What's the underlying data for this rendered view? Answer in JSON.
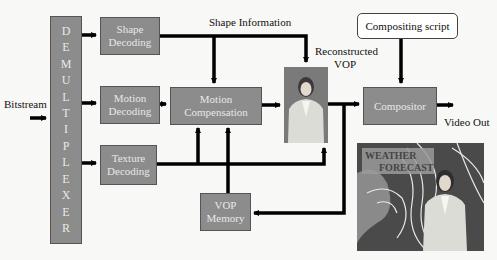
{
  "diagram": {
    "demux": {
      "letters": [
        "D",
        "E",
        "M",
        "U",
        "L",
        "T",
        "I",
        "P",
        "L",
        "E",
        "X",
        "E",
        "R"
      ]
    },
    "blocks": {
      "shape_decoding": [
        "Shape",
        "Decoding"
      ],
      "motion_decoding": [
        "Motion",
        "Decoding"
      ],
      "texture_decoding": [
        "Texture",
        "Decoding"
      ],
      "motion_compensation": [
        "Motion",
        "Compensation"
      ],
      "vop_memory": [
        "VOP",
        "Memory"
      ],
      "compositor": "Compositor",
      "compositing_script": "Compositing script"
    },
    "labels": {
      "bitstream": "Bitstream",
      "shape_information": "Shape Information",
      "reconstructed_vop": [
        "Reconstructed",
        "VOP"
      ],
      "video_out": "Video Out"
    },
    "output_image": {
      "overlay_text": [
        "WEATHER",
        "FORECAST"
      ]
    },
    "colors": {
      "block_fill": "#8c8c8c",
      "block_text": "#e8e8e8",
      "arrow": "#000000",
      "background": "#f8f8f6"
    }
  }
}
